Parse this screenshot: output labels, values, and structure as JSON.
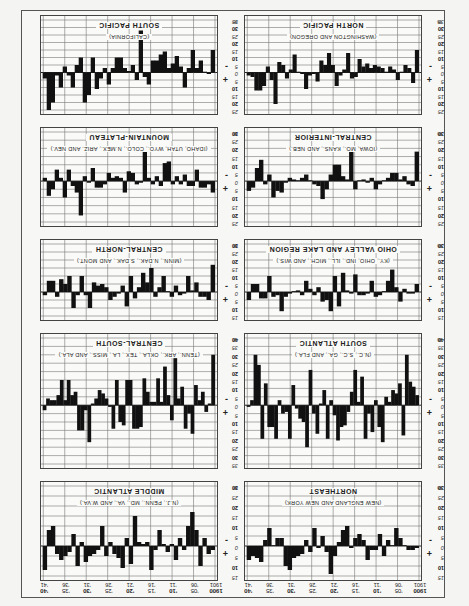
{
  "chart_data": {
    "type": "bar",
    "orientation_note": "sheet printed upside down (rotated 180 degrees)",
    "xlabel": "Year",
    "ylabel": "%",
    "x": [
      1900,
      1901,
      1902,
      1903,
      1904,
      1905,
      1906,
      1907,
      1908,
      1909,
      1910,
      1911,
      1912,
      1913,
      1914,
      1915,
      1916,
      1917,
      1918,
      1919,
      1920,
      1921,
      1922,
      1923,
      1924,
      1925,
      1926,
      1927,
      1928,
      1929,
      1930,
      1931,
      1932,
      1933,
      1934,
      1935,
      1936,
      1937,
      1938,
      1939,
      1940,
      1941
    ],
    "year_tick_labels": [
      {
        "top": "1900",
        "bottom": "1901"
      },
      {
        "top": "'05",
        "bottom": "'06"
      },
      {
        "top": "'10",
        "bottom": "'11"
      },
      {
        "top": "'15",
        "bottom": "'16"
      },
      {
        "top": "'20",
        "bottom": "'21"
      },
      {
        "top": "'25",
        "bottom": "'26"
      },
      {
        "top": "'30",
        "bottom": "'31"
      },
      {
        "top": "'35",
        "bottom": "'36"
      },
      {
        "top": "'40",
        "bottom": "'41"
      }
    ],
    "sign_labels": {
      "above": "+",
      "below": "-"
    },
    "unit_label": "%",
    "grid": true,
    "panels": [
      {
        "name": "NORTHEAST",
        "subtitle": "(NEW ENGLAND AND NEW YORK)",
        "ylim": [
          -30,
          15
        ],
        "ticks": [
          15,
          10,
          5,
          0,
          5,
          10,
          15,
          20,
          25,
          30
        ],
        "values": [
          1,
          2,
          2,
          0,
          -4,
          -9,
          0,
          -3,
          5,
          -6,
          2,
          2,
          7,
          -3,
          -6,
          -4,
          1,
          -10,
          -8,
          -2,
          5,
          14,
          3,
          -5,
          1,
          -9,
          3,
          -3,
          4,
          5,
          6,
          12,
          10,
          -4,
          -4,
          0,
          -9,
          -3,
          8,
          6,
          5,
          7
        ]
      },
      {
        "name": "MIDDLE ATLANTIC",
        "subtitle": "(N.J., PENN., MD., VA., AND W.VA.)",
        "ylim": [
          -30,
          15
        ],
        "ticks": [
          15,
          10,
          5,
          0,
          5,
          10,
          15,
          20,
          25,
          30
        ],
        "values": [
          2,
          4,
          -4,
          10,
          -8,
          -17,
          -10,
          2,
          -4,
          7,
          -1,
          3,
          -1,
          -8,
          2,
          12,
          -2,
          -1,
          -2,
          -15,
          9,
          -4,
          11,
          6,
          4,
          -2,
          5,
          -10,
          2,
          4,
          5,
          8,
          -2,
          10,
          -6,
          3,
          5,
          7,
          4,
          -10,
          -8,
          12
        ]
      },
      {
        "name": "SOUTH ATLANTIC",
        "subtitle": "(N.C., S.C., GA., AND FLA.)",
        "ylim": [
          -40,
          35
        ],
        "ticks": [
          35,
          30,
          25,
          20,
          15,
          10,
          5,
          0,
          5,
          10,
          15,
          20,
          25,
          30,
          35,
          40
        ],
        "values": [
          -6,
          -11,
          -14,
          -30,
          18,
          -13,
          -7,
          -9,
          -2,
          -5,
          22,
          13,
          -3,
          16,
          5,
          20,
          -17,
          -2,
          -21,
          -8,
          4,
          12,
          13,
          21,
          6,
          -3,
          20,
          -9,
          -1,
          17,
          5,
          -21,
          25,
          10,
          8,
          2,
          -12,
          20,
          4,
          5,
          -3,
          20,
          13,
          13,
          -13,
          20,
          -24,
          -30,
          -3,
          1
        ]
      },
      {
        "name": "CENTRAL-SOUTH",
        "subtitle": "(TENN., ARK., OKLA., TEX., LA., MISS., AND ALA.)",
        "ylim": [
          -40,
          35
        ],
        "ticks": [
          35,
          30,
          25,
          20,
          15,
          10,
          5,
          0,
          5,
          10,
          15,
          20,
          25,
          30,
          35,
          40
        ],
        "values": [
          -30,
          -1,
          4,
          -8,
          -3,
          -12,
          17,
          5,
          14,
          -11,
          -4,
          -28,
          9,
          -6,
          -23,
          -2,
          -16,
          -2,
          -2,
          -8,
          -16,
          13,
          14,
          14,
          -15,
          -15,
          12,
          10,
          -15,
          14,
          1,
          -4,
          -7,
          -9,
          -4,
          -1,
          22,
          3,
          15,
          15,
          -8,
          -6,
          -15,
          -3,
          -15,
          -6,
          -3,
          -3,
          -4,
          3
        ]
      },
      {
        "name": "OHIO VALLEY AND LAKE REGION",
        "subtitle": "(KY., OHIO, IND., ILL., MICH., AND WIS.)",
        "ylim": [
          -30,
          15
        ],
        "ticks": [
          15,
          10,
          5,
          0,
          5,
          10,
          15,
          20,
          25,
          30
        ],
        "values": [
          -5,
          1,
          1,
          -2,
          6,
          -3,
          -14,
          -7,
          0,
          2,
          3,
          -7,
          1,
          2,
          2,
          -11,
          1,
          -1,
          -12,
          9,
          -10,
          12,
          5,
          6,
          -3,
          2,
          -2,
          -7,
          2,
          -1,
          0,
          1,
          3,
          12,
          2,
          3,
          -10,
          4,
          4,
          -5,
          -5,
          5
        ]
      },
      {
        "name": "CENTRAL-NORTH",
        "subtitle": "(MINN., N.DAK., S.DAK., AND MONT.)",
        "ylim": [
          -30,
          15
        ],
        "ticks": [
          15,
          10,
          5,
          0,
          5,
          10,
          15,
          20,
          25,
          30
        ],
        "values": [
          -17,
          5,
          3,
          3,
          -6,
          -1,
          -10,
          1,
          2,
          -4,
          3,
          0,
          -10,
          -3,
          3,
          -15,
          -6,
          -12,
          -3,
          4,
          -10,
          9,
          -4,
          1,
          3,
          5,
          -3,
          -5,
          -4,
          -6,
          10,
          2,
          -10,
          2,
          10,
          -10,
          -5,
          -8,
          3,
          -7,
          -7,
          2
        ]
      },
      {
        "name": "CENTRAL-INTERIOR",
        "subtitle": "(IOWA, MO., KANS., AND NEB.)",
        "ylim": [
          -30,
          25
        ],
        "ticks": [
          25,
          20,
          15,
          10,
          5,
          0,
          5,
          10,
          15,
          20,
          25,
          30
        ],
        "values": [
          -18,
          3,
          2,
          -3,
          -1,
          -5,
          -5,
          -2,
          0,
          2,
          5,
          -2,
          1,
          -1,
          0,
          5,
          -18,
          -1,
          -3,
          -10,
          -10,
          -4,
          5,
          11,
          3,
          2,
          0,
          -4,
          -2,
          0,
          -1,
          -2,
          1,
          7,
          6,
          10,
          -4,
          2,
          -13,
          -8,
          4,
          6
        ]
      },
      {
        "name": "MOUNTAIN-PLATEAU",
        "subtitle": "(IDAHO, UTAH, WYO., COLO., N.MEX., ARIZ. AND NEV.)",
        "ylim": [
          -30,
          25
        ],
        "ticks": [
          25,
          20,
          15,
          10,
          5,
          0,
          5,
          10,
          15,
          20,
          25,
          30
        ],
        "values": [
          7,
          2,
          4,
          4,
          -7,
          3,
          3,
          -4,
          2,
          -3,
          2,
          -12,
          -11,
          3,
          -3,
          2,
          -2,
          -19,
          1,
          2,
          -5,
          -6,
          7,
          -2,
          -3,
          -2,
          -5,
          2,
          4,
          4,
          -8,
          1,
          -3,
          21,
          7,
          3,
          -7,
          10,
          -2,
          -7,
          5,
          9,
          -2
        ]
      },
      {
        "name": "NORTH PACIFIC",
        "subtitle": "(WASHINGTON AND OREGON)",
        "ylim": [
          -35,
          25
        ],
        "ticks": [
          25,
          20,
          15,
          10,
          5,
          0,
          5,
          10,
          15,
          20,
          25,
          30,
          35
        ],
        "values": [
          -15,
          7,
          -3,
          -5,
          0,
          5,
          -2,
          -4,
          0,
          -3,
          -4,
          -5,
          -3,
          -6,
          -4,
          -9,
          3,
          4,
          -13,
          -2,
          2,
          9,
          -5,
          -13,
          -5,
          -8,
          6,
          1,
          2,
          11,
          1,
          0,
          -12,
          -2,
          4,
          -5,
          -7,
          21,
          5,
          -4,
          9,
          12,
          12,
          3,
          2
        ]
      },
      {
        "name": "SOUTH PACIFIC",
        "subtitle": "(CALIFORNIA)",
        "ylim": [
          -35,
          25
        ],
        "ticks": [
          25,
          20,
          15,
          10,
          5,
          0,
          5,
          10,
          15,
          20,
          25,
          30,
          35
        ],
        "values": [
          -15,
          1,
          0,
          -8,
          -3,
          -15,
          -3,
          10,
          -4,
          -11,
          -6,
          -3,
          -14,
          -12,
          -8,
          -8,
          8,
          3,
          -28,
          5,
          -5,
          -1,
          -3,
          -10,
          -10,
          -3,
          8,
          -3,
          4,
          11,
          -10,
          15,
          20,
          -10,
          -5,
          10,
          2,
          -4,
          10,
          2,
          20,
          25,
          4
        ]
      }
    ]
  }
}
